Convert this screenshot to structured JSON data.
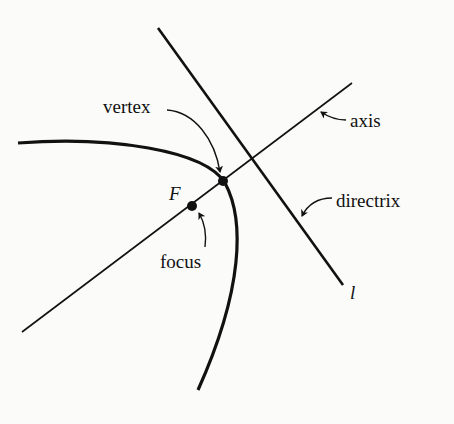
{
  "diagram": {
    "type": "parabola-definition",
    "labels": {
      "vertex": "vertex",
      "axis": "axis",
      "directrix": "directrix",
      "focus": "focus",
      "focus_point": "F",
      "directrix_line": "l"
    },
    "elements": [
      {
        "name": "parabola",
        "kind": "curve"
      },
      {
        "name": "axis",
        "kind": "line"
      },
      {
        "name": "directrix",
        "kind": "line",
        "label": "l"
      },
      {
        "name": "vertex",
        "kind": "point"
      },
      {
        "name": "focus",
        "kind": "point",
        "label": "F"
      }
    ],
    "colors": {
      "ink": "#111111",
      "background": "#fbfbf9"
    }
  }
}
